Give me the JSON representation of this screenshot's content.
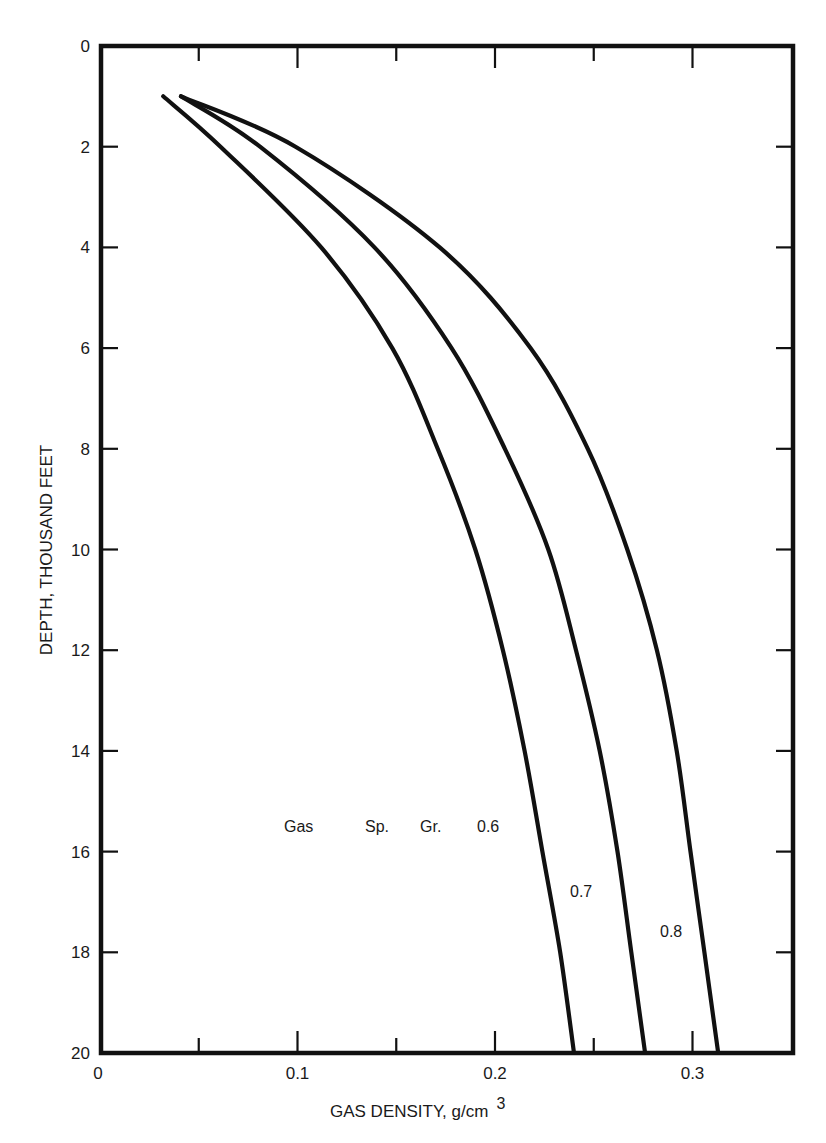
{
  "chart_data": {
    "type": "line",
    "title": "",
    "xlabel": "GAS DENSITY, g/cm",
    "xlabel_superscript": "3",
    "ylabel": "DEPTH,  THOUSAND FEET",
    "xlim": [
      0,
      0.35
    ],
    "ylim": [
      0,
      20
    ],
    "y_inverted": true,
    "grid": false,
    "legend": "none (curves labeled inline)",
    "x_ticks": [
      0,
      0.1,
      0.2,
      0.3
    ],
    "x_tick_labels": [
      "0",
      "0.1",
      "0.2",
      "0.3"
    ],
    "x_minor_ticks": [
      0.05,
      0.15,
      0.25,
      0.3
    ],
    "y_ticks": [
      0,
      2,
      4,
      6,
      8,
      10,
      12,
      14,
      16,
      18,
      20
    ],
    "y_tick_labels": [
      "0",
      "2",
      "4",
      "6",
      "8",
      "10",
      "12",
      "14",
      "16",
      "18",
      "20"
    ],
    "series": [
      {
        "name": "Gas Sp. Gr. 0.6",
        "label": "0.6",
        "depth": [
          1,
          2,
          4,
          6,
          8,
          10,
          12,
          14,
          16,
          18,
          20
        ],
        "density": [
          0.032,
          0.061,
          0.112,
          0.148,
          0.171,
          0.19,
          0.204,
          0.215,
          0.224,
          0.233,
          0.24
        ]
      },
      {
        "name": "Gas Sp. Gr. 0.7",
        "label": "0.7",
        "depth": [
          1,
          2,
          4,
          6,
          8,
          10,
          12,
          14,
          16,
          18,
          20
        ],
        "density": [
          0.041,
          0.081,
          0.139,
          0.178,
          0.205,
          0.227,
          0.241,
          0.253,
          0.262,
          0.269,
          0.276
        ]
      },
      {
        "name": "Gas Sp. Gr. 0.8",
        "label": "0.8",
        "depth": [
          1,
          2,
          4,
          6,
          8,
          10,
          12,
          14,
          16,
          18,
          20
        ],
        "density": [
          0.041,
          0.099,
          0.172,
          0.218,
          0.247,
          0.267,
          0.282,
          0.292,
          0.299,
          0.306,
          0.313
        ]
      }
    ],
    "annotations": [
      {
        "text": "Gas",
        "x": 0.094,
        "y": 15.8
      },
      {
        "text": "Sp.",
        "x": 0.135,
        "y": 15.8
      },
      {
        "text": "Gr.",
        "x": 0.164,
        "y": 15.8
      },
      {
        "text": "0.6",
        "x": 0.194,
        "y": 15.8
      },
      {
        "text": "0.7",
        "x": 0.24,
        "y": 16.6
      },
      {
        "text": "0.8",
        "x": 0.291,
        "y": 17.5
      }
    ]
  },
  "labels": {
    "x_axis_title": "GAS DENSITY, g/cm",
    "x_axis_title_sup": "3",
    "y_axis_title": "DEPTH,  THOUSAND FEET",
    "gas": "Gas",
    "sp": "Sp.",
    "gr": "Gr.",
    "sg_06": "0.6",
    "sg_07": "0.7",
    "sg_08": "0.8"
  }
}
